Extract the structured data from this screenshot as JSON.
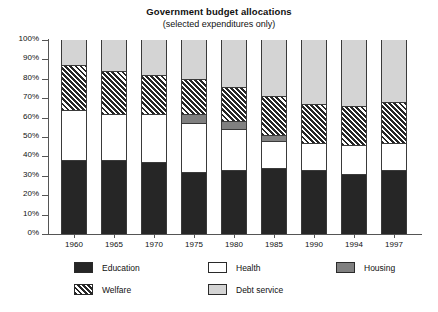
{
  "chart_data": {
    "type": "bar",
    "title": "Government budget allocations",
    "subtitle": "(selected expenditures only)",
    "xlabel": "",
    "ylabel": "",
    "stacked": true,
    "normalized_percent": true,
    "grid": false,
    "legend_position": "bottom",
    "ylim": [
      0,
      100
    ],
    "yticks": [
      "0%",
      "10%",
      "20%",
      "30%",
      "40%",
      "50%",
      "60%",
      "70%",
      "80%",
      "90%",
      "100%"
    ],
    "ytick_values": [
      0,
      10,
      20,
      30,
      40,
      50,
      60,
      70,
      80,
      90,
      100
    ],
    "categories": [
      "1960",
      "1965",
      "1970",
      "1975",
      "1980",
      "1985",
      "1990",
      "1994",
      "1997"
    ],
    "series": [
      {
        "name": "Education",
        "values": [
          38,
          38,
          37,
          32,
          33,
          34,
          33,
          31,
          33
        ]
      },
      {
        "name": "Health",
        "values": [
          26,
          24,
          25,
          25,
          21,
          14,
          14,
          15,
          14
        ]
      },
      {
        "name": "Housing",
        "values": [
          0,
          0,
          0,
          5,
          4,
          3,
          0,
          0,
          0
        ]
      },
      {
        "name": "Welfare",
        "values": [
          23,
          22,
          20,
          18,
          18,
          20,
          20,
          20,
          21
        ]
      },
      {
        "name": "Debt service",
        "values": [
          13,
          16,
          18,
          20,
          24,
          29,
          33,
          34,
          32
        ]
      }
    ]
  },
  "legend": {
    "entries": [
      {
        "label": "Education",
        "swatch": "solid-dark",
        "color": "#262626"
      },
      {
        "label": "Health",
        "swatch": "solid-white",
        "color": "#ffffff"
      },
      {
        "label": "Housing",
        "swatch": "solid-gray",
        "color": "#808080"
      },
      {
        "label": "Welfare",
        "swatch": "diagonal-hatch",
        "color": "#262626"
      },
      {
        "label": "Debt service",
        "swatch": "solid-light",
        "color": "#d4d4d4"
      }
    ]
  },
  "colors": {
    "education": "#262626",
    "health": "#ffffff",
    "housing": "#808080",
    "welfare": "#262626",
    "debt_service": "#d4d4d4",
    "axis": "#555555",
    "outline": "#3a3a3a",
    "background": "#ffffff",
    "text": "#111111"
  }
}
